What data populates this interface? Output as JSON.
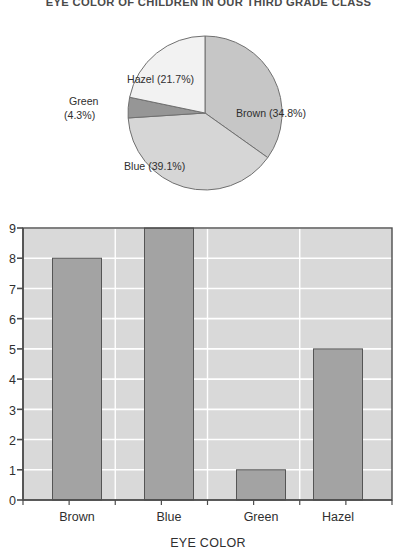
{
  "title": "EYE COLOR OF CHILDREN IN OUR THIRD GRADE CLASS",
  "colors": {
    "plot_background": "#d9d9d9",
    "gridline": "#ffffff",
    "bar_fill": "#a3a3a3",
    "bar_stroke": "#555555",
    "axis": "#4d4d4d",
    "text": "#2f2f2f",
    "pie_brown": "#c6c6c6",
    "pie_blue": "#d6d6d6",
    "pie_green": "#969696",
    "pie_hazel": "#f2f2f2",
    "pie_stroke": "#707070"
  },
  "chart_data": [
    {
      "type": "pie",
      "title": "EYE COLOR OF CHILDREN IN OUR THIRD GRADE CLASS",
      "categories": [
        "Brown",
        "Blue",
        "Green",
        "Hazel"
      ],
      "values": [
        34.8,
        39.1,
        4.3,
        21.7
      ],
      "value_unit": "percent",
      "start_angle_deg": 0,
      "direction": "clockwise",
      "labels": [
        "Brown (34.8%)",
        "Blue (39.1%)",
        "Green (4.3%)",
        "Hazel (21.7%)"
      ],
      "slice_colors": [
        "#c6c6c6",
        "#d6d6d6",
        "#969696",
        "#f2f2f2"
      ],
      "legend": "none",
      "grid": false
    },
    {
      "type": "bar",
      "categories": [
        "Brown",
        "Blue",
        "Green",
        "Hazel"
      ],
      "values": [
        8,
        9,
        1,
        5
      ],
      "title": "",
      "xlabel": "EYE COLOR",
      "ylabel": "",
      "ylim": [
        0,
        9
      ],
      "ytick_labels": [
        "0",
        "1",
        "2",
        "3",
        "4",
        "5",
        "6",
        "7",
        "8",
        "9"
      ],
      "ytick_values": [
        0,
        1,
        2,
        3,
        4,
        5,
        6,
        7,
        8,
        9
      ],
      "grid": true,
      "grid_axis": "y",
      "legend": "none"
    }
  ],
  "pie": {
    "slices": [
      {
        "name": "Brown",
        "label": "Brown (34.8%)",
        "percent": 34.8,
        "color": "#c6c6c6"
      },
      {
        "name": "Blue",
        "label": "Blue (39.1%)",
        "percent": 39.1,
        "color": "#d6d6d6"
      },
      {
        "name": "Green",
        "label_line1": "Green",
        "label_line2": "(4.3%)",
        "percent": 4.3,
        "color": "#969696"
      },
      {
        "name": "Hazel",
        "label": "Hazel (21.7%)",
        "percent": 21.7,
        "color": "#f2f2f2"
      }
    ]
  },
  "bar": {
    "xlabel": "EYE COLOR",
    "yticks": [
      "9",
      "8",
      "7",
      "6",
      "5",
      "4",
      "3",
      "2",
      "1",
      "0"
    ],
    "categories": [
      {
        "label": "Brown",
        "value": 8
      },
      {
        "label": "Blue",
        "value": 9
      },
      {
        "label": "Green",
        "value": 1
      },
      {
        "label": "Hazel",
        "value": 5
      }
    ]
  }
}
